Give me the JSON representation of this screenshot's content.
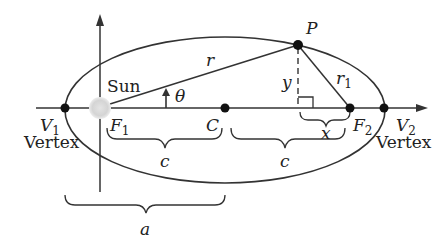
{
  "diagram": {
    "labels": {
      "P": "P",
      "r": "r",
      "r1": "r",
      "r1_sub": "1",
      "theta": "θ",
      "sun": "Sun",
      "y": "y",
      "x": "x",
      "V1": "V",
      "V1_sub": "1",
      "V2": "V",
      "V2_sub": "2",
      "F1": "F",
      "F1_sub": "1",
      "F2": "F",
      "F2_sub": "2",
      "C": "C",
      "c_left": "c",
      "c_right": "c",
      "a": "a",
      "vertex_left": "Vertex",
      "vertex_right": "Vertex"
    },
    "colors": {
      "stroke": "#333333",
      "point": "#111111",
      "sun": "#d0d0d0"
    }
  }
}
